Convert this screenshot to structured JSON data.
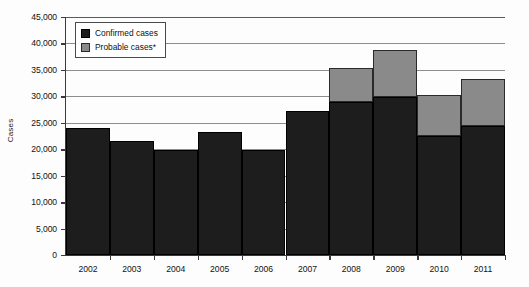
{
  "chart_data": {
    "type": "bar",
    "stacked": true,
    "title": "",
    "xlabel": "",
    "ylabel": "Cases",
    "ylim": [
      0,
      45000
    ],
    "ytick_step": 5000,
    "ytick_labels": [
      "0",
      "5,000",
      "10,000",
      "15,000",
      "20,000",
      "25,000",
      "30,000",
      "35,000",
      "40,000",
      "45,000"
    ],
    "ytick_values": [
      0,
      5000,
      10000,
      15000,
      20000,
      25000,
      30000,
      35000,
      40000,
      45000
    ],
    "grid": "horizontal",
    "legend_position": "top-left",
    "categories": [
      "2002",
      "2003",
      "2004",
      "2005",
      "2006",
      "2007",
      "2008",
      "2009",
      "2010",
      "2011"
    ],
    "series": [
      {
        "name": "Confirmed cases",
        "color": "#1d1d1d",
        "values": [
          24000,
          21500,
          19900,
          23300,
          19900,
          27300,
          28900,
          29900,
          22500,
          24400
        ]
      },
      {
        "name": "Probable cases*",
        "color": "#8a8a8a",
        "values": [
          0,
          0,
          0,
          0,
          0,
          0,
          6400,
          8800,
          7800,
          8900
        ]
      }
    ],
    "totals": [
      24000,
      21500,
      19900,
      23300,
      19900,
      27300,
      35300,
      38700,
      30300,
      33300
    ]
  },
  "legend": {
    "items": [
      {
        "label": "Confirmed cases",
        "swatch": "confirmed"
      },
      {
        "label": "Probable cases*",
        "swatch": "probable"
      }
    ]
  },
  "axis": {
    "y_title": "Cases"
  }
}
